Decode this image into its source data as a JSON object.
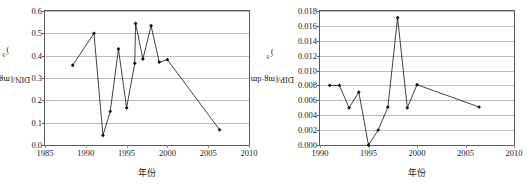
{
  "chart_data": [
    {
      "type": "line",
      "title": "",
      "panel_id": "din-panel",
      "xlabel": "年份",
      "ylabel": "DIN/(mg·dm-3)",
      "ylabel_parts": {
        "prefix": "DIN/(mg·dm",
        "exponent": "-3",
        "suffix": ")"
      },
      "xlim": [
        1985,
        2010
      ],
      "ylim": [
        0.0,
        0.6
      ],
      "xticks": [
        "1985",
        "1990",
        "1995",
        "2000",
        "2005",
        "2010"
      ],
      "xtick_values": [
        1985,
        1990,
        1995,
        2000,
        2005,
        2010
      ],
      "yticks": [
        "0.0",
        "0.1",
        "0.2",
        "0.3",
        "0.4",
        "0.5",
        "0.6"
      ],
      "ytick_values": [
        0.0,
        0.1,
        0.2,
        0.3,
        0.4,
        0.5,
        0.6
      ],
      "grid": true,
      "legend": "none",
      "x": [
        1988.4,
        1991.0,
        1992.1,
        1993.0,
        1994.0,
        1995.0,
        1996.0,
        1996.1,
        1997.0,
        1998.0,
        1999.0,
        2000.0,
        2006.4
      ],
      "values": [
        0.357,
        0.5,
        0.043,
        0.151,
        0.43,
        0.166,
        0.366,
        0.544,
        0.385,
        0.534,
        0.371,
        0.382,
        0.068
      ],
      "marker": "diamond"
    },
    {
      "type": "line",
      "title": "",
      "panel_id": "dip-panel",
      "xlabel": "年份",
      "ylabel": "DIP/(mg·dm-3)",
      "ylabel_parts": {
        "prefix": "DIP/(mg·dm",
        "exponent": "-3",
        "suffix": ")"
      },
      "xlim": [
        1990,
        2010
      ],
      "ylim": [
        0.0,
        0.018
      ],
      "xticks": [
        "1990",
        "1995",
        "2000",
        "2005",
        "2010"
      ],
      "xtick_values": [
        1990,
        1995,
        2000,
        2005,
        2010
      ],
      "yticks": [
        "0.000",
        "0.002",
        "0.004",
        "0.006",
        "0.008",
        "0.010",
        "0.012",
        "0.014",
        "0.016",
        "0.018"
      ],
      "ytick_values": [
        0.0,
        0.002,
        0.004,
        0.006,
        0.008,
        0.01,
        0.012,
        0.014,
        0.016,
        0.018
      ],
      "grid": true,
      "legend": "none",
      "x": [
        1991.0,
        1992.0,
        1993.0,
        1994.0,
        1995.0,
        1996.0,
        1997.0,
        1998.0,
        1999.0,
        2000.0,
        2006.4
      ],
      "values": [
        0.008,
        0.008,
        0.005,
        0.0071,
        0.0,
        0.002,
        0.0051,
        0.0171,
        0.005,
        0.0081,
        0.0051
      ],
      "marker": "diamond"
    }
  ],
  "colors": {
    "line": "#111111",
    "marker": "#111111",
    "grid": "#bdbdbd",
    "frame": "#5a5a5a",
    "text": "#222222",
    "background": "#ffffff"
  }
}
